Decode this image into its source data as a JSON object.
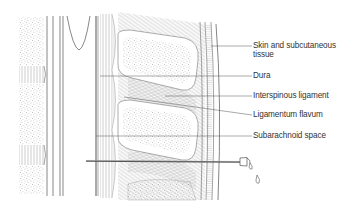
{
  "diagram": {
    "labels": [
      {
        "id": "skin",
        "line1": "Skin and subcutaneous",
        "line2": "tissue"
      },
      {
        "id": "dura",
        "line1": "Dura"
      },
      {
        "id": "interspinous",
        "line1": "Interspinous ligament"
      },
      {
        "id": "flavum",
        "line1": "Ligamentum flavum"
      },
      {
        "id": "subarachnoid",
        "line1": "Subarachnoid space"
      }
    ],
    "colors": {
      "line": "#555555",
      "hatch": "#8a8a8a",
      "stipple": "#9a9a9a",
      "text": "#333333"
    }
  }
}
